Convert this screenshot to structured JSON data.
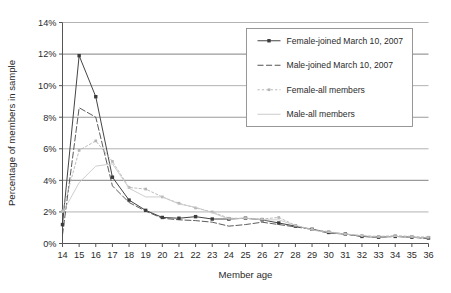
{
  "chart_data": {
    "type": "line",
    "title": "",
    "xlabel": "Member age",
    "ylabel": "Percentage of members in sample",
    "x": [
      14,
      15,
      16,
      17,
      18,
      19,
      20,
      21,
      22,
      23,
      24,
      25,
      26,
      27,
      28,
      29,
      30,
      31,
      32,
      33,
      34,
      35,
      36
    ],
    "xlim": [
      14,
      36
    ],
    "ylim": [
      0,
      14
    ],
    "yticks": [
      0,
      2,
      4,
      6,
      8,
      10,
      12,
      14
    ],
    "ytick_labels": [
      "0%",
      "2%",
      "4%",
      "6%",
      "8%",
      "10%",
      "12%",
      "14%"
    ],
    "xtick_labels": [
      "14",
      "15",
      "16",
      "17",
      "18",
      "19",
      "20",
      "21",
      "22",
      "23",
      "24",
      "25",
      "26",
      "27",
      "28",
      "29",
      "30",
      "31",
      "32",
      "33",
      "34",
      "35",
      "36"
    ],
    "grid": "horizontal",
    "legend_position": "upper-right",
    "series": [
      {
        "name": "Female-joined March 10, 2007",
        "color": "#3a3a3a",
        "line_style": "solid",
        "marker": "square",
        "values": [
          1.2,
          11.9,
          9.3,
          4.2,
          2.75,
          2.1,
          1.65,
          1.6,
          1.7,
          1.55,
          1.55,
          1.6,
          1.5,
          1.3,
          1.1,
          0.9,
          0.7,
          0.6,
          0.45,
          0.4,
          0.45,
          0.4,
          0.35
        ]
      },
      {
        "name": "Male-joined March 10, 2007",
        "color": "#4a4a4a",
        "line_style": "dashed",
        "marker": "none",
        "values": [
          0.55,
          8.6,
          8.0,
          3.65,
          2.6,
          2.05,
          1.6,
          1.5,
          1.45,
          1.35,
          1.1,
          1.2,
          1.35,
          1.2,
          1.05,
          0.9,
          0.65,
          0.6,
          0.45,
          0.4,
          0.45,
          0.4,
          0.3
        ]
      },
      {
        "name": "Female-all members",
        "color": "#b5b5b5",
        "line_style": "dotted",
        "marker": "square",
        "values": [
          2.05,
          5.9,
          6.5,
          5.2,
          3.55,
          3.45,
          2.95,
          2.55,
          2.25,
          2.0,
          1.6,
          1.6,
          1.55,
          1.65,
          1.15,
          0.9,
          0.75,
          0.6,
          0.5,
          0.45,
          0.5,
          0.45,
          0.4
        ]
      },
      {
        "name": "Male-all members",
        "color": "#c8c8c8",
        "line_style": "solid",
        "marker": "none",
        "values": [
          1.95,
          3.85,
          4.9,
          5.05,
          3.5,
          2.95,
          2.95,
          2.5,
          2.3,
          1.95,
          1.55,
          1.6,
          1.5,
          1.5,
          1.15,
          0.85,
          0.7,
          0.6,
          0.5,
          0.4,
          0.45,
          0.4,
          0.35
        ]
      }
    ]
  },
  "axes": {
    "x_title": "Member age",
    "y_title": "Percentage of members in sample"
  },
  "legend": {
    "entries": [
      {
        "label": "Female-joined March 10, 2007"
      },
      {
        "label": "Male-joined March 10, 2007"
      },
      {
        "label": "Female-all members"
      },
      {
        "label": "Male-all members"
      }
    ]
  },
  "colors": {
    "axis": "#555555",
    "grid": "#9a9a9a",
    "background": "#ffffff",
    "text": "#2b2b2b",
    "legend_border": "#8d8d8d"
  }
}
